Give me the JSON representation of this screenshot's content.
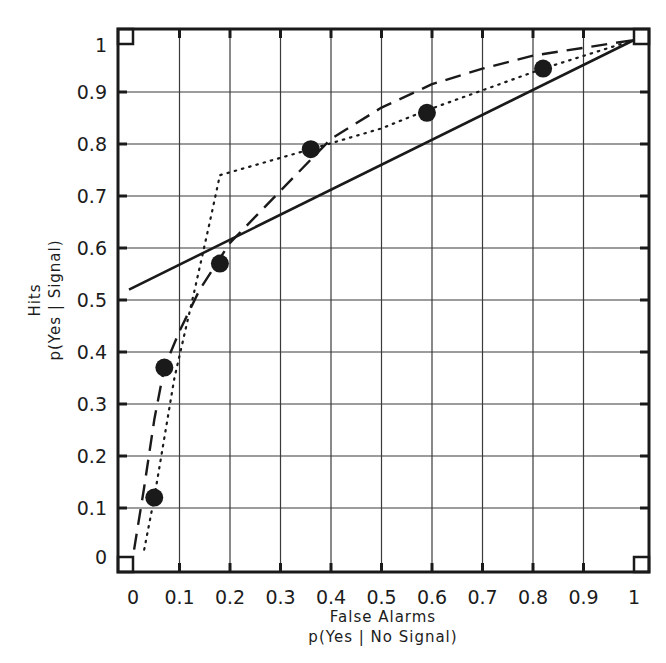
{
  "chart_data": {
    "type": "line",
    "title": "",
    "xlabel": "False Alarms",
    "xlabel_sub": "p(Yes | No Signal)",
    "ylabel": "Hits",
    "ylabel_sub": "p(Yes | Signal)",
    "xlim": [
      0,
      1
    ],
    "ylim": [
      0,
      1
    ],
    "grid": true,
    "legend": null,
    "x_ticks": [
      "0",
      "0.1",
      "0.2",
      "0.3",
      "0.4",
      "0.5",
      "0.6",
      "0.7",
      "0.8",
      "0.9",
      "1"
    ],
    "y_ticks": [
      "0",
      "0.1",
      "0.2",
      "0.3",
      "0.4",
      "0.5",
      "0.6",
      "0.7",
      "0.8",
      "0.9",
      "1"
    ],
    "points": {
      "name": "observed data",
      "style": "filled-circle",
      "x": [
        0.05,
        0.07,
        0.18,
        0.36,
        0.59,
        0.82
      ],
      "y": [
        0.12,
        0.37,
        0.57,
        0.79,
        0.86,
        0.945
      ]
    },
    "series": [
      {
        "name": "solid straight line",
        "style": "solid",
        "x": [
          0.0,
          1.0
        ],
        "y": [
          0.52,
          1.0
        ]
      },
      {
        "name": "dashed curve",
        "style": "dashed",
        "x": [
          0.01,
          0.03,
          0.05,
          0.07,
          0.1,
          0.14,
          0.2,
          0.3,
          0.4,
          0.5,
          0.6,
          0.7,
          0.8,
          0.9,
          1.0
        ],
        "y": [
          0.02,
          0.14,
          0.27,
          0.37,
          0.44,
          0.52,
          0.61,
          0.71,
          0.81,
          0.87,
          0.915,
          0.945,
          0.97,
          0.985,
          1.0
        ]
      },
      {
        "name": "dotted curve",
        "style": "dotted",
        "x": [
          0.03,
          0.05,
          0.09,
          0.13,
          0.16,
          0.18,
          0.36,
          0.5,
          0.59,
          0.82,
          1.0
        ],
        "y": [
          0.02,
          0.12,
          0.35,
          0.52,
          0.65,
          0.74,
          0.79,
          0.83,
          0.865,
          0.945,
          1.0
        ]
      }
    ]
  },
  "colors": {
    "ink": "#1a1a1a",
    "grid": "#3a3a3a",
    "background": "#ffffff"
  }
}
